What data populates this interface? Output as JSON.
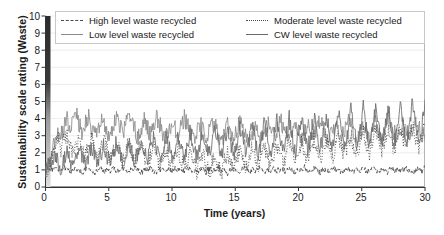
{
  "chart_data": {
    "type": "line",
    "title": "",
    "xlabel": "Time (years)",
    "ylabel": "Sustainability scale rating (Waste)",
    "xlim": [
      0,
      30
    ],
    "ylim": [
      0,
      10
    ],
    "xticks": [
      "0",
      "5",
      "10",
      "15",
      "20",
      "25",
      "30"
    ],
    "yticks": [
      "0",
      "1",
      "2",
      "3",
      "4",
      "5",
      "6",
      "7",
      "8",
      "9",
      "10"
    ],
    "grid": "horizontal",
    "legend_position": "top-inside",
    "series": [
      {
        "name": "High level waste recycled",
        "style": "dashed",
        "color": "#4a4a4a",
        "mean": 0.95,
        "values": [
          0.9,
          1.05,
          0.95,
          1.2,
          1.0,
          0.85,
          1.15,
          1.05,
          0.9,
          1.0,
          1.1,
          0.95,
          0.8,
          1.05,
          1.2,
          0.95,
          0.85,
          1.0,
          1.1,
          0.9,
          1.05,
          0.95,
          1.15,
          0.85,
          1.0,
          1.1,
          0.95,
          0.9,
          1.05,
          1.2,
          1.0,
          0.85,
          0.95,
          1.1,
          1.05,
          0.9,
          0.8,
          1.0,
          1.15,
          0.95,
          1.05,
          0.9,
          1.1,
          1.0,
          0.85,
          0.95,
          1.2,
          1.05,
          0.9,
          1.0,
          0.95,
          1.1,
          0.85,
          1.05,
          1.0,
          0.9,
          1.15,
          0.95,
          1.05,
          0.8,
          1.0,
          1.1,
          0.9,
          0.95,
          1.05,
          1.2,
          0.85,
          1.0,
          0.95,
          1.1,
          1.05,
          0.9,
          1.0,
          0.85,
          1.15,
          0.95,
          1.05,
          1.0,
          0.9,
          1.1,
          0.95,
          0.85,
          1.05,
          1.0,
          1.2,
          0.9,
          0.95,
          1.1,
          1.0,
          0.85,
          1.05,
          0.95,
          0.9,
          1.15,
          1.0,
          1.05,
          0.85,
          0.95,
          1.1,
          1.0,
          0.9,
          1.05,
          0.95,
          1.2,
          0.85,
          1.0,
          1.1,
          0.95,
          0.9,
          1.05,
          1.0,
          0.85,
          1.15,
          0.95,
          1.05,
          0.9,
          1.0,
          1.1,
          0.95,
          0.85,
          1.05,
          1.0,
          0.9,
          1.2
        ]
      },
      {
        "name": "Low level waste recycled",
        "style": "solid",
        "color": "#8a8a8a",
        "mean": 3.3,
        "values": [
          0.9,
          1.4,
          2.1,
          2.6,
          3.2,
          2.9,
          3.6,
          4.0,
          3.4,
          3.9,
          4.3,
          3.6,
          3.1,
          3.8,
          4.2,
          3.5,
          3.0,
          3.4,
          4.1,
          3.7,
          3.2,
          2.8,
          3.5,
          4.0,
          3.6,
          3.1,
          3.7,
          4.2,
          3.8,
          3.3,
          2.9,
          3.4,
          3.9,
          3.5,
          3.0,
          3.6,
          4.1,
          3.7,
          3.2,
          2.8,
          3.3,
          3.8,
          3.4,
          3.0,
          3.5,
          4.0,
          3.6,
          3.1,
          2.7,
          3.2,
          3.7,
          3.3,
          2.9,
          3.4,
          3.9,
          3.5,
          3.1,
          2.6,
          3.1,
          3.6,
          3.2,
          2.8,
          3.3,
          3.8,
          3.4,
          3.0,
          2.5,
          3.0,
          3.5,
          3.1,
          2.7,
          3.2,
          3.7,
          3.3,
          2.9,
          3.4,
          3.9,
          3.5,
          3.0,
          2.6,
          3.1,
          3.6,
          3.2,
          2.8,
          3.3,
          3.8,
          3.4,
          3.0,
          3.5,
          4.0,
          3.6,
          3.1,
          2.7,
          3.2,
          3.7,
          3.3,
          2.9,
          3.4,
          3.9,
          3.5,
          3.0,
          2.6,
          3.1,
          3.6,
          3.2,
          2.8,
          3.3,
          3.8,
          3.4,
          3.0,
          3.5,
          4.0,
          3.6,
          3.2,
          2.8,
          3.3,
          3.8,
          3.4,
          3.0,
          3.5,
          3.9,
          3.5,
          3.1,
          2.7
        ]
      },
      {
        "name": "Moderate level waste recycled",
        "style": "dotted",
        "color": "#4a4a4a",
        "mean": 2.0,
        "values": [
          0.9,
          1.3,
          1.8,
          2.4,
          2.9,
          2.2,
          2.7,
          3.1,
          2.4,
          1.9,
          2.5,
          3.0,
          2.3,
          1.8,
          2.4,
          2.9,
          2.2,
          1.7,
          2.3,
          2.8,
          2.1,
          1.6,
          2.2,
          2.7,
          2.0,
          1.5,
          2.1,
          2.6,
          1.9,
          1.4,
          2.0,
          2.5,
          1.8,
          1.3,
          1.9,
          2.4,
          1.7,
          1.2,
          1.8,
          2.3,
          1.6,
          1.1,
          1.7,
          2.2,
          1.5,
          1.0,
          1.6,
          2.1,
          1.4,
          0.9,
          1.5,
          2.0,
          1.3,
          0.8,
          1.4,
          1.9,
          1.2,
          0.8,
          1.5,
          2.1,
          1.4,
          0.9,
          1.6,
          2.2,
          1.5,
          1.0,
          1.7,
          2.3,
          1.6,
          1.1,
          1.8,
          2.4,
          1.7,
          1.2,
          1.9,
          2.5,
          1.8,
          1.3,
          2.0,
          2.6,
          1.9,
          1.4,
          2.1,
          2.7,
          2.0,
          1.5,
          2.2,
          2.8,
          2.1,
          1.6,
          2.3,
          2.9,
          2.2,
          1.7,
          2.4,
          3.0,
          2.3,
          1.8,
          2.5,
          3.1,
          2.4,
          1.9,
          2.6,
          3.2,
          2.5,
          2.0,
          2.7,
          3.3,
          2.6,
          2.1,
          2.8,
          3.4,
          2.7,
          2.2,
          2.9,
          3.5,
          2.8,
          2.3,
          3.0,
          3.6,
          2.9,
          2.4,
          3.1,
          3.7
        ]
      },
      {
        "name": "CW level waste recycled",
        "style": "solid",
        "color": "#6a6a6a",
        "mean": 1.7,
        "values": [
          0.9,
          1.2,
          1.6,
          2.0,
          1.5,
          1.1,
          1.7,
          2.2,
          1.6,
          1.2,
          1.8,
          2.3,
          1.7,
          1.3,
          1.9,
          2.4,
          1.8,
          1.3,
          1.9,
          2.5,
          1.8,
          1.4,
          2.0,
          2.6,
          1.9,
          1.4,
          2.0,
          2.7,
          2.0,
          1.5,
          2.1,
          2.8,
          2.1,
          1.5,
          2.2,
          2.9,
          2.2,
          1.6,
          2.2,
          3.0,
          2.3,
          1.6,
          2.3,
          3.1,
          2.3,
          1.7,
          2.4,
          3.2,
          2.4,
          1.7,
          2.4,
          3.3,
          2.5,
          1.8,
          2.5,
          3.4,
          2.5,
          1.8,
          2.6,
          3.5,
          2.6,
          1.9,
          2.6,
          3.6,
          2.7,
          1.9,
          2.7,
          3.7,
          2.7,
          2.0,
          2.8,
          3.8,
          2.8,
          2.0,
          2.8,
          3.9,
          2.9,
          2.1,
          2.9,
          4.0,
          2.9,
          2.1,
          3.0,
          4.1,
          3.0,
          2.2,
          3.0,
          4.2,
          3.1,
          2.2,
          3.1,
          4.3,
          3.1,
          2.3,
          3.2,
          4.4,
          3.2,
          2.3,
          3.2,
          4.5,
          3.3,
          2.4,
          3.3,
          4.6,
          3.3,
          2.4,
          3.4,
          4.7,
          3.4,
          2.5,
          3.4,
          4.8,
          3.5,
          2.5,
          3.5,
          4.9,
          3.5,
          2.6,
          3.6,
          5.0,
          3.6,
          2.6,
          3.6,
          5.1
        ]
      }
    ]
  },
  "legend": {
    "entries": [
      {
        "label": "High level waste recycled",
        "style": "dashed"
      },
      {
        "label": "Low level waste recycled",
        "style": "solid"
      },
      {
        "label": "Moderate level waste recycled",
        "style": "dotted"
      },
      {
        "label": "CW level waste recycled",
        "style": "solid"
      }
    ]
  },
  "axes": {
    "y_title": "Sustainability scale rating (Waste)",
    "x_title": "Time (years)",
    "y_ticks": [
      "10",
      "9",
      "8",
      "7",
      "6",
      "5",
      "4",
      "3",
      "2",
      "1",
      "0"
    ],
    "x_ticks": [
      "0",
      "5",
      "10",
      "15",
      "20",
      "25",
      "30"
    ]
  }
}
